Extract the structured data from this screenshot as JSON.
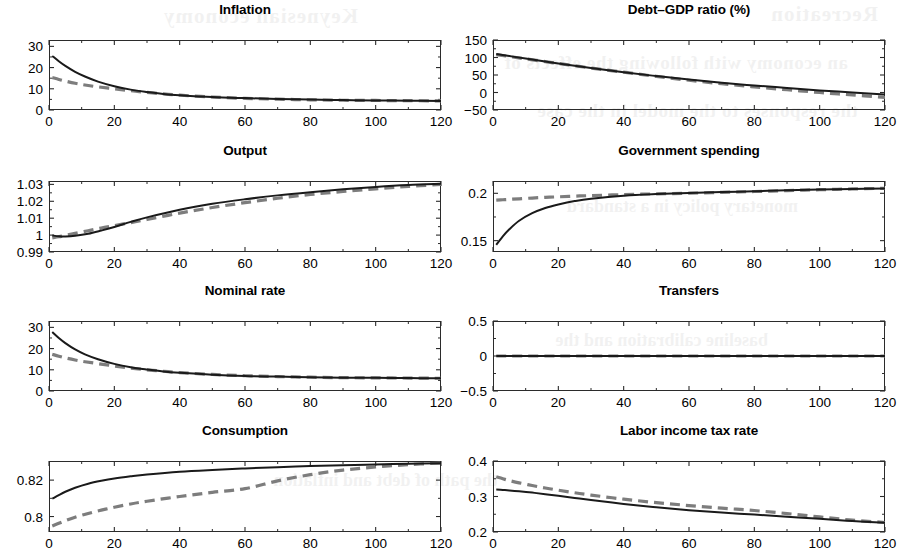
{
  "figure": {
    "rows": 4,
    "cols": 2,
    "line_styles": {
      "solid_color": "#1a1a1a",
      "dashed_color": "#7d7d7d"
    },
    "background_bleed": [
      "Recreation",
      "Keynesian economy",
      "an economy with following the effects of",
      "the responses to the model in the case",
      "monetary policy in a standard",
      "baseline calibration and the",
      "the path of debt and inflation"
    ]
  },
  "chart_data": [
    {
      "type": "line",
      "title": "Inflation",
      "xlabel": "",
      "ylabel": "",
      "xlim": [
        0,
        120
      ],
      "ylim": [
        0,
        33
      ],
      "xticks": [
        0,
        20,
        40,
        60,
        80,
        100,
        120
      ],
      "yticks": [
        0,
        10,
        20,
        30
      ],
      "ytick_labels": [
        "0",
        "10",
        "20",
        "30"
      ],
      "grid": false,
      "legend": "none",
      "x": [
        1,
        3,
        5,
        8,
        11,
        15,
        20,
        25,
        30,
        35,
        40,
        50,
        60,
        70,
        80,
        90,
        100,
        110,
        120
      ],
      "series": [
        {
          "name": "solid",
          "style": "solid",
          "values": [
            25.5,
            23.0,
            20.8,
            18.0,
            15.8,
            13.4,
            11.2,
            9.6,
            8.5,
            7.6,
            7.0,
            6.1,
            5.6,
            5.2,
            4.9,
            4.7,
            4.5,
            4.4,
            4.3
          ]
        },
        {
          "name": "dashed",
          "style": "dashed",
          "values": [
            15.3,
            14.4,
            13.6,
            12.6,
            11.8,
            10.9,
            10.0,
            9.1,
            8.3,
            7.6,
            7.0,
            6.1,
            5.5,
            5.1,
            4.8,
            4.6,
            4.5,
            4.4,
            4.3
          ]
        }
      ]
    },
    {
      "type": "line",
      "title": "Debt–GDP ratio (%)",
      "xlabel": "",
      "ylabel": "",
      "xlim": [
        0,
        120
      ],
      "ylim": [
        -50,
        150
      ],
      "xticks": [
        0,
        20,
        40,
        60,
        80,
        100,
        120
      ],
      "yticks": [
        -50,
        0,
        50,
        100,
        150
      ],
      "ytick_labels": [
        "−50",
        "0",
        "50",
        "100",
        "150"
      ],
      "grid": false,
      "legend": "none",
      "x": [
        1,
        5,
        10,
        20,
        30,
        40,
        50,
        60,
        70,
        80,
        90,
        100,
        110,
        120
      ],
      "series": [
        {
          "name": "solid",
          "style": "solid",
          "values": [
            110,
            104,
            97,
            83,
            70,
            58,
            47,
            37,
            28,
            20,
            13,
            6,
            0,
            -6
          ]
        },
        {
          "name": "dashed",
          "style": "dashed",
          "values": [
            108,
            103,
            96,
            83,
            70,
            58,
            46,
            35,
            25,
            16,
            8,
            0,
            -7,
            -14
          ]
        }
      ]
    },
    {
      "type": "line",
      "title": "Output",
      "xlabel": "",
      "ylabel": "",
      "xlim": [
        0,
        120
      ],
      "ylim": [
        0.99,
        1.032
      ],
      "xticks": [
        0,
        20,
        40,
        60,
        80,
        100,
        120
      ],
      "yticks": [
        0.99,
        1,
        1.01,
        1.02,
        1.03
      ],
      "ytick_labels": [
        "0.99",
        "1",
        "1.01",
        "1.02",
        "1.03"
      ],
      "grid": false,
      "legend": "none",
      "x": [
        1,
        3,
        5,
        8,
        12,
        16,
        20,
        25,
        30,
        40,
        50,
        60,
        70,
        80,
        90,
        100,
        110,
        120
      ],
      "series": [
        {
          "name": "solid",
          "style": "solid",
          "values": [
            0.9998,
            0.9993,
            0.9992,
            0.9996,
            1.0008,
            1.0027,
            1.0048,
            1.0078,
            1.0105,
            1.015,
            1.0185,
            1.0212,
            1.0235,
            1.0254,
            1.0271,
            1.0285,
            1.0296,
            1.0303
          ]
        },
        {
          "name": "dashed",
          "style": "dashed",
          "values": [
            0.9984,
            0.999,
            0.9998,
            1.001,
            1.0026,
            1.0042,
            1.0056,
            1.0074,
            1.0092,
            1.013,
            1.0163,
            1.0192,
            1.0218,
            1.024,
            1.0258,
            1.0274,
            1.0288,
            1.03
          ]
        }
      ]
    },
    {
      "type": "line",
      "title": "Government spending",
      "xlabel": "",
      "ylabel": "",
      "xlim": [
        0,
        120
      ],
      "ylim": [
        0.138,
        0.213
      ],
      "xticks": [
        0,
        20,
        40,
        60,
        80,
        100,
        120
      ],
      "yticks": [
        0.15,
        0.2
      ],
      "ytick_labels": [
        "0.15",
        "0.2"
      ],
      "grid": false,
      "legend": "none",
      "x": [
        1,
        3,
        5,
        8,
        12,
        16,
        20,
        25,
        30,
        40,
        50,
        60,
        70,
        80,
        90,
        100,
        110,
        120
      ],
      "series": [
        {
          "name": "solid",
          "style": "solid",
          "values": [
            0.1455,
            0.1545,
            0.162,
            0.171,
            0.179,
            0.1845,
            0.1882,
            0.1918,
            0.1943,
            0.1975,
            0.1992,
            0.2003,
            0.2013,
            0.2022,
            0.2031,
            0.2039,
            0.2046,
            0.2052
          ]
        },
        {
          "name": "dashed",
          "style": "dashed",
          "values": [
            0.1928,
            0.1932,
            0.1936,
            0.1942,
            0.195,
            0.1957,
            0.1963,
            0.197,
            0.1976,
            0.1986,
            0.1994,
            0.2001,
            0.201,
            0.2019,
            0.2029,
            0.2038,
            0.2046,
            0.2053
          ]
        }
      ]
    },
    {
      "type": "line",
      "title": "Nominal rate",
      "xlabel": "",
      "ylabel": "",
      "xlim": [
        0,
        120
      ],
      "ylim": [
        0,
        33
      ],
      "xticks": [
        0,
        20,
        40,
        60,
        80,
        100,
        120
      ],
      "yticks": [
        0,
        10,
        20,
        30
      ],
      "ytick_labels": [
        "0",
        "10",
        "20",
        "30"
      ],
      "grid": false,
      "legend": "none",
      "x": [
        1,
        3,
        5,
        8,
        11,
        15,
        20,
        25,
        30,
        35,
        40,
        50,
        60,
        70,
        80,
        90,
        100,
        110,
        120
      ],
      "series": [
        {
          "name": "solid",
          "style": "solid",
          "values": [
            27.8,
            25.0,
            22.6,
            19.6,
            17.3,
            15.0,
            12.8,
            11.2,
            10.1,
            9.2,
            8.6,
            7.7,
            7.1,
            6.8,
            6.5,
            6.3,
            6.2,
            6.1,
            6.0
          ]
        },
        {
          "name": "dashed",
          "style": "dashed",
          "values": [
            17.3,
            16.4,
            15.6,
            14.6,
            13.8,
            12.9,
            11.8,
            10.8,
            10.0,
            9.3,
            8.7,
            7.8,
            7.2,
            6.8,
            6.5,
            6.3,
            6.2,
            6.1,
            6.0
          ]
        }
      ]
    },
    {
      "type": "line",
      "title": "Transfers",
      "xlabel": "",
      "ylabel": "",
      "xlim": [
        0,
        120
      ],
      "ylim": [
        -0.5,
        0.5
      ],
      "xticks": [
        0,
        20,
        40,
        60,
        80,
        100,
        120
      ],
      "yticks": [
        -0.5,
        0,
        0.5
      ],
      "ytick_labels": [
        "−0.5",
        "0",
        "0.5"
      ],
      "grid": false,
      "legend": "none",
      "x": [
        1,
        20,
        40,
        60,
        80,
        100,
        120
      ],
      "series": [
        {
          "name": "solid",
          "style": "solid",
          "values": [
            0,
            0,
            0,
            0,
            0,
            0,
            0
          ]
        },
        {
          "name": "dashed",
          "style": "dashed",
          "values": [
            0,
            0,
            0,
            0,
            0,
            0,
            0
          ]
        }
      ]
    },
    {
      "type": "line",
      "title": "Consumption",
      "xlabel": "",
      "ylabel": "",
      "xlim": [
        0,
        120
      ],
      "ylim": [
        0.7915,
        0.8305
      ],
      "xticks": [
        0,
        20,
        40,
        60,
        80,
        100,
        120
      ],
      "yticks": [
        0.8,
        0.82
      ],
      "ytick_labels": [
        "0.8",
        "0.82"
      ],
      "grid": false,
      "legend": "none",
      "x": [
        1,
        3,
        5,
        8,
        12,
        16,
        20,
        25,
        30,
        40,
        50,
        60,
        70,
        80,
        90,
        100,
        110,
        120
      ],
      "series": [
        {
          "name": "solid",
          "style": "solid",
          "values": [
            0.8098,
            0.8118,
            0.8136,
            0.8158,
            0.818,
            0.8196,
            0.8209,
            0.8221,
            0.8231,
            0.8246,
            0.8256,
            0.8264,
            0.8271,
            0.8277,
            0.8282,
            0.8286,
            0.829,
            0.8293
          ]
        },
        {
          "name": "dashed",
          "style": "dashed",
          "values": [
            0.7948,
            0.7963,
            0.7977,
            0.7996,
            0.8017,
            0.8035,
            0.8051,
            0.8069,
            0.8084,
            0.811,
            0.8133,
            0.8153,
            0.8196,
            0.823,
            0.8255,
            0.8272,
            0.8285,
            0.8294
          ]
        }
      ]
    },
    {
      "type": "line",
      "title": "Labor income tax rate",
      "xlabel": "",
      "ylabel": "",
      "xlim": [
        0,
        120
      ],
      "ylim": [
        0.2,
        0.4
      ],
      "xticks": [
        0,
        20,
        40,
        60,
        80,
        100,
        120
      ],
      "yticks": [
        0.2,
        0.3,
        0.4
      ],
      "ytick_labels": [
        "0.2",
        "0.3",
        "0.4"
      ],
      "grid": false,
      "legend": "none",
      "x": [
        1,
        3,
        5,
        8,
        12,
        16,
        20,
        25,
        30,
        40,
        50,
        60,
        70,
        80,
        90,
        100,
        110,
        120
      ],
      "series": [
        {
          "name": "solid",
          "style": "solid",
          "values": [
            0.3195,
            0.3185,
            0.3172,
            0.3148,
            0.311,
            0.3065,
            0.3018,
            0.2958,
            0.29,
            0.279,
            0.2695,
            0.2615,
            0.2548,
            0.249,
            0.243,
            0.237,
            0.231,
            0.2262
          ]
        },
        {
          "name": "dashed",
          "style": "dashed",
          "values": [
            0.3555,
            0.35,
            0.345,
            0.3385,
            0.331,
            0.324,
            0.3178,
            0.3105,
            0.304,
            0.2925,
            0.2828,
            0.2745,
            0.2672,
            0.2605,
            0.252,
            0.2425,
            0.2335,
            0.2268
          ]
        }
      ]
    }
  ]
}
